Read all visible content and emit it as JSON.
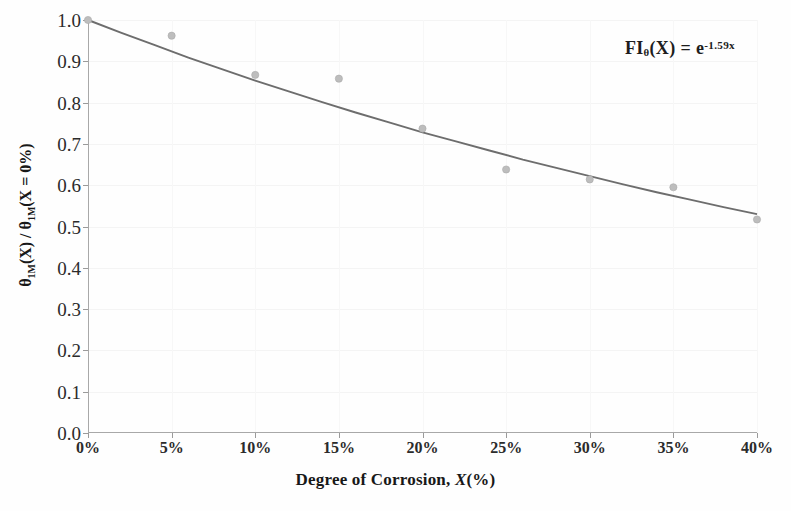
{
  "chart_data": {
    "type": "scatter",
    "title": "",
    "subtitle": "",
    "xlabel": "Degree of Corrosion, X(%)",
    "ylabel": "θ₁ₘ(X) / θ₁ₘ(X = 0%)",
    "xlim": [
      0,
      40
    ],
    "ylim": [
      0,
      1.0
    ],
    "grid": true,
    "legend_position": "none",
    "x_tick_labels": [
      "0%",
      "5%",
      "10%",
      "15%",
      "20%",
      "25%",
      "30%",
      "35%",
      "40%"
    ],
    "x_tick_values": [
      0,
      5,
      10,
      15,
      20,
      25,
      30,
      35,
      40
    ],
    "y_tick_labels": [
      "0.0",
      "0.1",
      "0.2",
      "0.3",
      "0.4",
      "0.5",
      "0.6",
      "0.7",
      "0.8",
      "0.9",
      "1.0"
    ],
    "y_tick_values": [
      0.0,
      0.1,
      0.2,
      0.3,
      0.4,
      0.5,
      0.6,
      0.7,
      0.8,
      0.9,
      1.0
    ],
    "series": [
      {
        "name": "measured-ratio",
        "marker": "circle",
        "color": "#bdbdbd",
        "x": [
          0,
          5,
          10,
          15,
          20,
          25,
          30,
          35,
          40
        ],
        "values": [
          1.0,
          0.962,
          0.867,
          0.858,
          0.737,
          0.638,
          0.614,
          0.595,
          0.517
        ]
      },
      {
        "name": "fitted-curve",
        "marker": "none",
        "color": "#6d6d6d",
        "equation_decay_rate": 1.59,
        "x": [
          0,
          2,
          4,
          6,
          8,
          10,
          12,
          14,
          16,
          18,
          20,
          22,
          24,
          26,
          28,
          30,
          32,
          34,
          36,
          38,
          40
        ],
        "values": [
          1.0,
          0.969,
          0.939,
          0.909,
          0.881,
          0.853,
          0.827,
          0.801,
          0.776,
          0.752,
          0.728,
          0.706,
          0.684,
          0.662,
          0.642,
          0.622,
          0.602,
          0.583,
          0.565,
          0.547,
          0.53
        ]
      }
    ],
    "annotations": [
      {
        "name": "fit-equation",
        "text": "FIθ(X) = e-1.59x",
        "lhs_main": "FI",
        "lhs_sub": "θ",
        "lhs_arg": "(X)",
        "equals": "=",
        "rhs_base": "e",
        "rhs_exponent": "-1.59x",
        "position": "top-right"
      }
    ],
    "axis_title_x_main": "Degree of Corrosion, ",
    "axis_title_x_italic": "X",
    "axis_title_x_tail": "(%)",
    "axis_title_y_num_main": "θ",
    "axis_title_y_num_sub": "1M",
    "axis_title_y_num_arg": "(X)",
    "axis_title_y_slash": " / ",
    "axis_title_y_den_main": "θ",
    "axis_title_y_den_sub": "1M",
    "axis_title_y_den_arg": "(X = 0%)"
  },
  "colors": {
    "marker": "#bdbdbd",
    "curve": "#6d6d6d",
    "axis": "#a8a8a8",
    "gridline": "#f4f4f4",
    "text": "#1d1d1d",
    "background": "#fefefe"
  }
}
